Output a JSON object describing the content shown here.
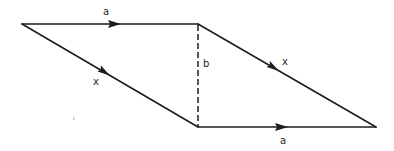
{
  "diagram": {
    "type": "vector-parallelogram",
    "vertices": {
      "top_left": [
        22,
        24
      ],
      "top_right": [
        198,
        24
      ],
      "bottom_left": [
        198,
        127
      ],
      "bottom_right": [
        376,
        127
      ]
    },
    "edges": [
      {
        "id": "top",
        "from": "top_left",
        "to": "top_right",
        "label": "a",
        "style": "solid",
        "arrow": true
      },
      {
        "id": "left",
        "from": "top_left",
        "to": "bottom_left",
        "label": "x",
        "style": "solid",
        "arrow": true
      },
      {
        "id": "right",
        "from": "top_right",
        "to": "bottom_right",
        "label": "x",
        "style": "solid",
        "arrow": true
      },
      {
        "id": "bottom",
        "from": "bottom_left",
        "to": "bottom_right",
        "label": "a",
        "style": "solid",
        "arrow": true
      },
      {
        "id": "middle",
        "from": "top_right",
        "to": "bottom_left",
        "label": "b",
        "style": "dashed",
        "arrow": false
      }
    ],
    "labels": {
      "top": "a",
      "left": "x",
      "middle": "b",
      "right": "x",
      "bottom": "a"
    },
    "colors": {
      "stroke": "#1e1e1e",
      "text": "#2a2a2a",
      "background": "#ffffff"
    }
  }
}
